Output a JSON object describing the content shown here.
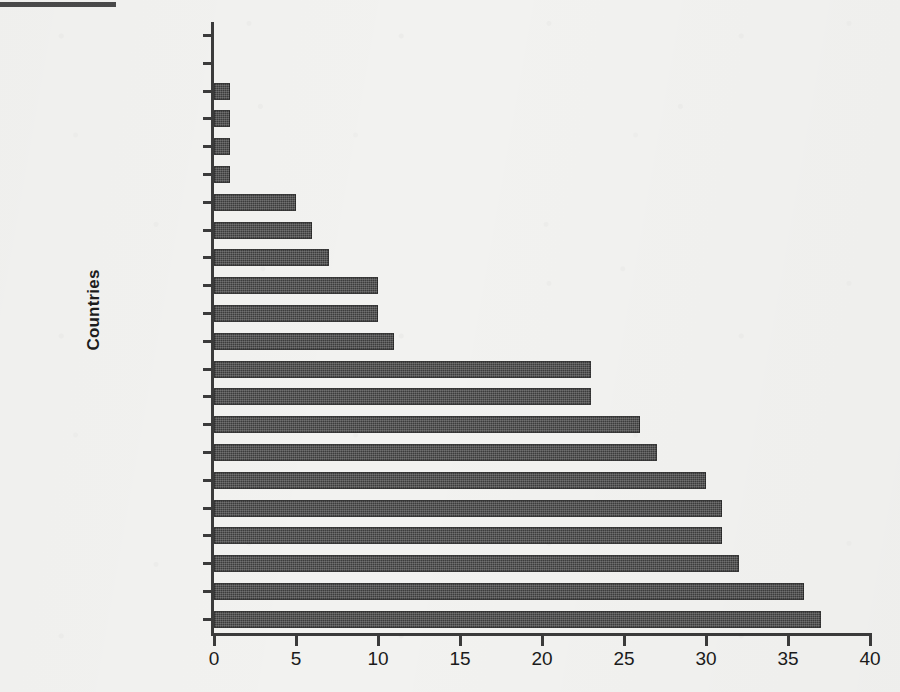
{
  "chart_data": {
    "type": "bar",
    "orientation": "horizontal",
    "title": "",
    "xlabel": "",
    "ylabel": "Countries",
    "xlim": [
      0,
      40
    ],
    "xticks": [
      0,
      5,
      10,
      15,
      20,
      25,
      30,
      35,
      40
    ],
    "grid": false,
    "legend": null,
    "bar_color": "#3c3c3c",
    "background_color": "#f2f2f0",
    "categories": [
      "Kenya",
      "Bangladesh",
      "South Africa",
      "India",
      "Philippines",
      "Egypt",
      "Saudi Arabia",
      "Colombia",
      "Malaysia",
      "Mexico",
      "Argentina",
      "Russia",
      "Ireland",
      "Australia",
      "United States",
      "Japan",
      "Canada",
      "United Kingdom",
      "Belgium",
      "Germany",
      "South Korea",
      "Denmark"
    ],
    "values": [
      0,
      0,
      1,
      1,
      1,
      1,
      5,
      6,
      7,
      10,
      10,
      11,
      23,
      23,
      26,
      27,
      30,
      31,
      31,
      32,
      36,
      37
    ]
  }
}
